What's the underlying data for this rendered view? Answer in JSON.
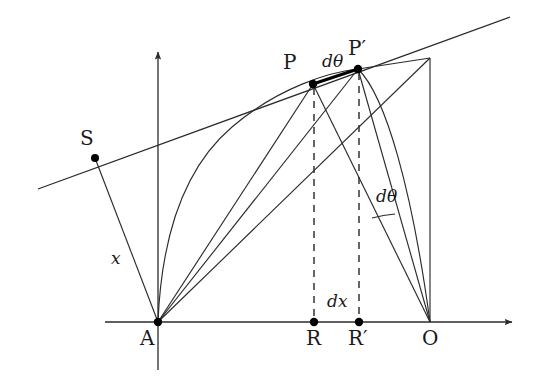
{
  "figure": {
    "background_color": "#ffffff",
    "stroke_color": "#2b2b2b",
    "bold_stroke_color": "#000000",
    "dashed_stroke_color": "#333333",
    "point_color": "#000000"
  },
  "labels": {
    "S": "S",
    "P": "P",
    "P_prime": "P",
    "P_prime_mark": "′",
    "A": "A",
    "R": "R",
    "R_prime": "R",
    "R_prime_mark": "′",
    "O": "O",
    "x": "x",
    "dx": "dx",
    "dtheta_top": "dθ",
    "dtheta_right": "dθ"
  },
  "points": {
    "A": {
      "x": 158,
      "y": 322,
      "dot": true,
      "label": "A"
    },
    "S": {
      "x": 95,
      "y": 158,
      "dot": true,
      "label": "S"
    },
    "P": {
      "x": 313,
      "y": 84,
      "dot": true,
      "label": "P"
    },
    "P_prime": {
      "x": 358,
      "y": 69,
      "dot": true,
      "label": "P'"
    },
    "R": {
      "x": 314,
      "y": 322,
      "dot": true,
      "label": "R"
    },
    "R_prime": {
      "x": 359,
      "y": 322,
      "dot": true,
      "label": "R'"
    },
    "O": {
      "x": 430,
      "y": 322,
      "dot": false,
      "label": "O"
    },
    "T": {
      "x": 430,
      "y": 58,
      "dot": false,
      "label": ""
    }
  },
  "axes": {
    "x_axis": {
      "x1": 105,
      "y1": 322,
      "x2": 518,
      "y2": 322,
      "arrow": "right"
    },
    "y_axis": {
      "x1": 158,
      "y1": 370,
      "x2": 158,
      "y2": 46,
      "arrow": "up"
    }
  },
  "tangent_line": {
    "x1": 38,
    "y1": 189,
    "x2": 510,
    "y2": 17
  },
  "label_positions": {
    "S": {
      "left": 80,
      "top": 128
    },
    "P": {
      "left": 283,
      "top": 52
    },
    "P_prime": {
      "left": 348,
      "top": 38
    },
    "A": {
      "left": 140,
      "top": 328
    },
    "R": {
      "left": 306,
      "top": 328
    },
    "R_prime": {
      "left": 348,
      "top": 328
    },
    "O": {
      "left": 422,
      "top": 328
    },
    "x": {
      "left": 111,
      "top": 250
    },
    "dx": {
      "left": 327,
      "top": 293
    },
    "dtheta_top": {
      "left": 322,
      "top": 53
    },
    "dtheta_right": {
      "left": 376,
      "top": 188
    }
  }
}
